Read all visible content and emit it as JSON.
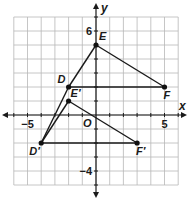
{
  "diagram": {
    "type": "coordinate-grid-transformation",
    "axes": {
      "x_label": "x",
      "y_label": "y",
      "origin_label": "O",
      "x_range": [
        -6,
        6
      ],
      "y_range": [
        -5,
        7
      ],
      "tick_labels": [
        {
          "axis": "x",
          "value": -5,
          "text": "−5"
        },
        {
          "axis": "x",
          "value": 5,
          "text": "5"
        },
        {
          "axis": "y",
          "value": 6,
          "text": "6"
        },
        {
          "axis": "y",
          "value": -4,
          "text": "−4"
        }
      ]
    },
    "points": [
      {
        "id": "D",
        "label": "D",
        "x": -2,
        "y": 2
      },
      {
        "id": "E",
        "label": "E",
        "x": 0,
        "y": 5
      },
      {
        "id": "F",
        "label": "F",
        "x": 5,
        "y": 2
      },
      {
        "id": "Dp",
        "label": "D′",
        "x": -4,
        "y": -2
      },
      {
        "id": "Ep",
        "label": "E′",
        "x": -2,
        "y": 1
      },
      {
        "id": "Fp",
        "label": "F′",
        "x": 3,
        "y": -2
      }
    ],
    "segments": [
      [
        "D",
        "E"
      ],
      [
        "E",
        "F"
      ],
      [
        "D",
        "F"
      ],
      [
        "Dp",
        "Ep"
      ],
      [
        "Ep",
        "Fp"
      ],
      [
        "Dp",
        "Fp"
      ],
      [
        "Dp",
        "D"
      ]
    ],
    "colors": {
      "grid": "#b8b8b8",
      "axis": "#1a1a1a",
      "segment": "#1a1a1a",
      "point": "#111111",
      "background": "#ffffff"
    }
  }
}
